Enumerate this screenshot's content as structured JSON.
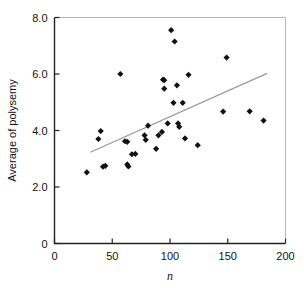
{
  "chart_data": {
    "type": "scatter",
    "title": "",
    "xlabel": "n",
    "ylabel": "Average of polysemy",
    "xlim": [
      0,
      200
    ],
    "ylim": [
      0,
      8.0
    ],
    "grid": false,
    "legend": null,
    "x_ticks": [
      "0",
      "50",
      "100",
      "150",
      "200"
    ],
    "x_tick_values": [
      0,
      50,
      100,
      150,
      200
    ],
    "y_ticks": [
      "0",
      "2.0",
      "4.0",
      "6.0",
      "8.0"
    ],
    "y_tick_values": [
      0,
      2.0,
      4.0,
      6.0,
      8.0
    ],
    "marker": "diamond",
    "marker_color": "#111111",
    "points": [
      {
        "x": 28,
        "y": 2.52
      },
      {
        "x": 38,
        "y": 3.7
      },
      {
        "x": 40,
        "y": 3.98
      },
      {
        "x": 42,
        "y": 2.72
      },
      {
        "x": 44,
        "y": 2.75
      },
      {
        "x": 57,
        "y": 6.0
      },
      {
        "x": 61,
        "y": 3.62
      },
      {
        "x": 63,
        "y": 3.6
      },
      {
        "x": 63,
        "y": 2.8
      },
      {
        "x": 64,
        "y": 2.73
      },
      {
        "x": 67,
        "y": 3.16
      },
      {
        "x": 70,
        "y": 3.17
      },
      {
        "x": 78,
        "y": 3.83
      },
      {
        "x": 79,
        "y": 3.67
      },
      {
        "x": 81,
        "y": 4.17
      },
      {
        "x": 88,
        "y": 3.35
      },
      {
        "x": 90,
        "y": 3.83
      },
      {
        "x": 93,
        "y": 3.95
      },
      {
        "x": 94,
        "y": 5.8
      },
      {
        "x": 95,
        "y": 5.78
      },
      {
        "x": 95,
        "y": 5.48
      },
      {
        "x": 98,
        "y": 4.25
      },
      {
        "x": 101,
        "y": 7.55
      },
      {
        "x": 103,
        "y": 4.98
      },
      {
        "x": 104,
        "y": 7.15
      },
      {
        "x": 106,
        "y": 5.6
      },
      {
        "x": 107,
        "y": 4.25
      },
      {
        "x": 108,
        "y": 4.13
      },
      {
        "x": 111,
        "y": 4.98
      },
      {
        "x": 113,
        "y": 3.72
      },
      {
        "x": 116,
        "y": 5.97
      },
      {
        "x": 124,
        "y": 3.48
      },
      {
        "x": 146,
        "y": 4.67
      },
      {
        "x": 149,
        "y": 6.58
      },
      {
        "x": 169,
        "y": 4.68
      },
      {
        "x": 181,
        "y": 4.35
      }
    ],
    "trend_line": {
      "color": "#999999",
      "x_start": 31,
      "y_start": 3.23,
      "x_end": 184,
      "y_end": 6.02
    }
  }
}
